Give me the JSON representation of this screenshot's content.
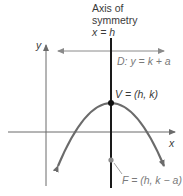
{
  "diagram": {
    "title_line1": "Axis of",
    "title_line2": "symmetry",
    "axis_equation": "x = h",
    "y_axis_label": "y",
    "x_axis_label": "x",
    "directrix_label": "D: y = k + a",
    "vertex_label": "V = (h, k)",
    "focus_label": "F = (h, k − a)",
    "colors": {
      "parabola": "#6b6b6b",
      "axes": "#6b6b6b",
      "axis_of_symmetry": "#1a1a1a",
      "directrix": "#8a8a8a",
      "vertex_point": "#111111",
      "focus_point": "#8a8a8a",
      "text": "#3a3a3a",
      "muted_text": "#7a7a7a"
    },
    "geometry": {
      "vertex": [
        111,
        103
      ],
      "focus": [
        111,
        160
      ],
      "directrix_y": 51,
      "x_axis_y": 132,
      "y_axis_x": 46
    }
  }
}
